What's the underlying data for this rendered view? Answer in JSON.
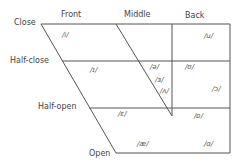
{
  "diagram": {
    "columns": [
      "Front",
      "Middle",
      "Back"
    ],
    "rows": [
      "Close",
      "Half-close",
      "Half-open",
      "Open"
    ],
    "vowels": [
      {
        "symbol": "/i/",
        "position": "close front"
      },
      {
        "symbol": "/u/",
        "position": "close back"
      },
      {
        "symbol": "/ɪ/",
        "position": "half-close front"
      },
      {
        "symbol": "/ə/",
        "position": "half-close middle"
      },
      {
        "symbol": "/ʊ/",
        "position": "half-close back"
      },
      {
        "symbol": "/ɜ/",
        "position": "middle"
      },
      {
        "symbol": "/ʌ/",
        "position": "middle"
      },
      {
        "symbol": "/ɔ/",
        "position": "back"
      },
      {
        "symbol": "/ɛ/",
        "position": "half-open front"
      },
      {
        "symbol": "/ɒ/",
        "position": "half-open back"
      },
      {
        "symbol": "/æ/",
        "position": "open front"
      },
      {
        "symbol": "/ɑ/",
        "position": "open back"
      }
    ]
  }
}
